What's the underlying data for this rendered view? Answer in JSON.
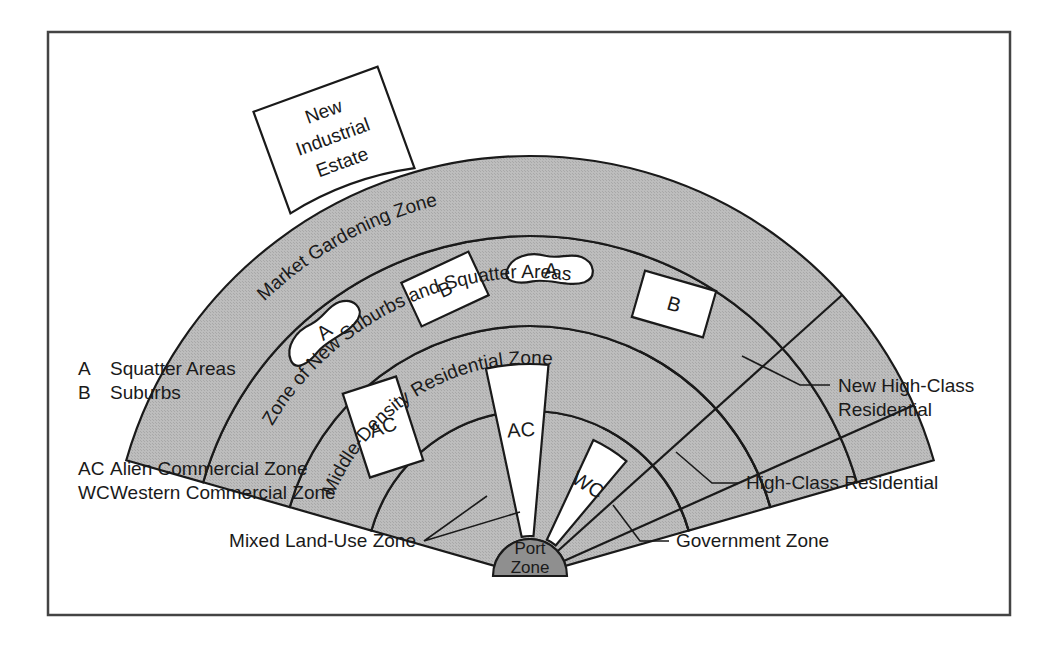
{
  "figure": {
    "kind": "land-use-sector-diagram",
    "frame": {
      "stroke": "#444444",
      "x": 48,
      "y": 32,
      "width": 962,
      "height": 583
    }
  },
  "colors": {
    "zone_fill": "#b9b9b9",
    "port_fill": "#8f8f8f",
    "white_fill": "#ffffff",
    "outline": "#1a1a1a",
    "text": "#1a1a1a",
    "page_background": "#ffffff"
  },
  "center": {
    "x": 530,
    "y": 576
  },
  "rings": [
    {
      "name": "port-zone",
      "label": "Port Zone",
      "r_inner": 0,
      "r_outer": 37,
      "fill": "port_fill"
    },
    {
      "name": "inner-zone",
      "r_inner": 37,
      "r_outer": 165,
      "fill": "zone_fill"
    },
    {
      "name": "middle-density-residential-zone",
      "label": "Middle-Density Residential Zone",
      "r_inner": 165,
      "r_outer": 250,
      "fill": "zone_fill"
    },
    {
      "name": "zone-of-new-suburbs-and-squatter-areas",
      "label": "Zone of New Suburbs and Squatter Areas",
      "r_inner": 250,
      "r_outer": 340,
      "fill": "zone_fill"
    },
    {
      "name": "market-gardening-zone",
      "label": "Market Gardening Zone",
      "r_inner": 340,
      "r_outer": 420,
      "fill": "zone_fill"
    }
  ],
  "arc_labels": [
    {
      "id": "market-gardening",
      "text": "Market Gardening Zone",
      "radius": 382,
      "start_angle": 212,
      "sweep": 58,
      "font_size": 19
    },
    {
      "id": "new-suburbs-squatter",
      "text": "Zone of New Suburbs and Squatter Areas",
      "radius": 298,
      "start_angle": 205,
      "sweep": 78,
      "font_size": 19
    },
    {
      "id": "middle-density",
      "text": "Middle-Density Residential Zone",
      "radius": 212,
      "start_angle": 202,
      "sweep": 74,
      "font_size": 19
    }
  ],
  "inner_marks": [
    {
      "id": "suburb-b-left",
      "code": "B",
      "shape": "rect",
      "x": 408,
      "y": 265,
      "w": 74,
      "h": 48,
      "rotate": -25
    },
    {
      "id": "suburb-b-right",
      "code": "B",
      "shape": "rect",
      "x": 637,
      "y": 280,
      "w": 74,
      "h": 48,
      "rotate": 16
    },
    {
      "id": "squatter-a-left",
      "code": "A",
      "shape": "blob",
      "cx": 323,
      "cy": 330,
      "rotate": -38
    },
    {
      "id": "squatter-a-right",
      "code": "A",
      "shape": "blob",
      "cx": 551,
      "cy": 268,
      "rotate": 2
    },
    {
      "id": "alien-commercial-small",
      "code": "AC",
      "shape": "rect",
      "x": 355,
      "y": 383,
      "w": 56,
      "h": 88,
      "rotate": -18
    },
    {
      "id": "alien-commercial-wedge",
      "code": "AC",
      "shape": "wedge",
      "start_angle": 258,
      "end_angle": 275,
      "r_inner": 40,
      "r_outer": 212
    },
    {
      "id": "western-commercial-wedge",
      "code": "WC",
      "shape": "wedge",
      "start_angle": 295,
      "end_angle": 310,
      "r_inner": 40,
      "r_outer": 150
    }
  ],
  "new_industrial_estate": {
    "label_lines": [
      "New",
      "Industrial",
      "Estate"
    ],
    "rotate": -20,
    "x": 268,
    "y": 86,
    "w": 132,
    "h": 108
  },
  "legend": [
    {
      "code": "A",
      "text": "Squatter Areas"
    },
    {
      "code": "B",
      "text": "Suburbs"
    },
    {
      "code": "AC",
      "text": "Alien Commercial Zone"
    },
    {
      "code": "WC",
      "text": "Western Commercial Zone"
    }
  ],
  "callouts": [
    {
      "id": "new-high-class-residential",
      "lines": [
        "New High-Class",
        "Residential"
      ],
      "text_x": 838,
      "text_y": 392,
      "anchor": "start",
      "leader": "M 830 385 L 800 385 L 742 356"
    },
    {
      "id": "high-class-residential",
      "lines": [
        "High-Class Residential"
      ],
      "text_x": 746,
      "text_y": 489,
      "anchor": "start",
      "leader": "M 739 483 L 712 483 L 676 452"
    },
    {
      "id": "government-zone",
      "lines": [
        "Government Zone"
      ],
      "text_x": 676,
      "text_y": 547,
      "anchor": "start",
      "leader": "M 669 541 L 640 541 L 613 505"
    },
    {
      "id": "mixed-land-use-zone",
      "lines": [
        "Mixed Land-Use Zone"
      ],
      "text_x": 416,
      "text_y": 547,
      "anchor": "end",
      "leader": "M 424 541 L 520 512 M 424 541 L 487 496"
    }
  ],
  "legend_position": {
    "x": 78,
    "y": 375,
    "code_x": 78,
    "text_x": 110,
    "line_height": 24,
    "gap_before_ac": 52
  },
  "fan": {
    "start_angle": 196,
    "end_angle": 344
  }
}
